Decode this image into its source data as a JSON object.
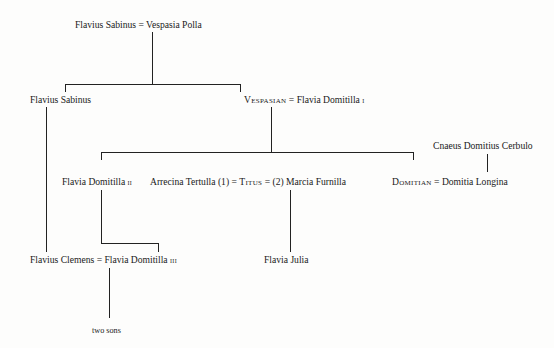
{
  "diagram": {
    "type": "family-tree",
    "generations": [
      {
        "level": 1,
        "couples": [
          {
            "a": "Flavius Sabinus",
            "sep": "=",
            "b": "Vespasia Polla"
          }
        ]
      },
      {
        "level": 2,
        "people": [
          {
            "name": "Flavius Sabinus"
          },
          {
            "a": "Vespasian",
            "sep": "=",
            "b": "Flavia Domitilla",
            "b_ordinal": "i"
          }
        ]
      },
      {
        "level": 3,
        "people": [
          {
            "name": "Flavia Domitilla",
            "ordinal": "ii"
          },
          {
            "spouse1": "Arrecina Tertulla",
            "num1": "(1)",
            "sep1": "=",
            "main": "Titus",
            "sep2": "=",
            "num2": "(2)",
            "spouse2": "Marcia Furnilla"
          },
          {
            "a": "Domitian",
            "sep": "=",
            "b": "Domitia Longina"
          },
          {
            "name": "Cnaeus Domitius Cerbulo",
            "note": "father of Domitia Longina"
          }
        ]
      },
      {
        "level": 4,
        "people": [
          {
            "a": "Flavius Clemens",
            "sep": "=",
            "b": "Flavia Domitilla",
            "b_ordinal": "iii"
          },
          {
            "name": "Flavia Julia"
          }
        ]
      },
      {
        "level": 5,
        "people": [
          {
            "name": "two sons"
          }
        ]
      }
    ]
  },
  "labels": {
    "top_a": "Flavius Sabinus",
    "eq": "=",
    "top_b": "Vespasia Polla",
    "sabinus_jr": "Flavius Sabinus",
    "vespasian": "Vespasian",
    "domitilla_1": "Flavia Domitilla",
    "ord_1": "i",
    "domitilla_2": "Flavia Domitilla",
    "ord_2": "ii",
    "arrecina": "Arrecina Tertulla",
    "num_1": "(1)",
    "titus": "Titus",
    "num_2": "(2)",
    "marcia": "Marcia Furnilla",
    "domitian": "Domitian",
    "domitia": "Domitia Longina",
    "cerbulo": "Cnaeus Domitius Cerbulo",
    "clemens": "Flavius Clemens",
    "domitilla_3": "Flavia Domitilla",
    "ord_3": "iii",
    "julia": "Flavia Julia",
    "sons": "two sons"
  }
}
